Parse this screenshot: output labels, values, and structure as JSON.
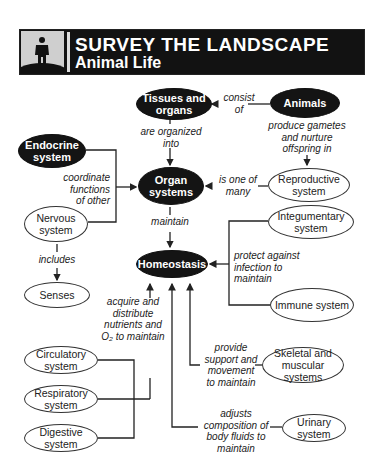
{
  "header": {
    "title": "SURVEY THE LANDSCAPE",
    "subtitle": "Animal Life",
    "icon": "person-on-hill-icon"
  },
  "nodes": {
    "tissues": "Tissues and organs",
    "animals": "Animals",
    "endocrine": "Endocrine system",
    "organ_systems": "Organ systems",
    "reproductive": "Reproductive system",
    "nervous": "Nervous system",
    "integumentary": "Integumentary system",
    "homeostasis": "Homeostasis",
    "senses": "Senses",
    "immune": "Immune system",
    "circulatory": "Circulatory system",
    "respiratory": "Respiratory system",
    "digestive": "Digestive system",
    "skeletal": "Skeletal and muscular systems",
    "urinary": "Urinary system"
  },
  "links": {
    "consist_of": "consist\nof",
    "produce_gametes": "produce gametes\nand nurture\noffspring in",
    "are_organized_into": "are organized\ninto",
    "coordinate": "coordinate\nfunctions\nof other",
    "is_one_of_many": "is one of\nmany",
    "maintain": "maintain",
    "includes": "includes",
    "protect": "protect against\ninfection to\nmaintain",
    "acquire": "acquire and\ndistribute\nnutrients and\nO₂ to maintain",
    "provide": "provide\nsupport and\nmovement\nto maintain",
    "adjusts": "adjusts\ncomposition of\nbody fluids to\nmaintain"
  }
}
